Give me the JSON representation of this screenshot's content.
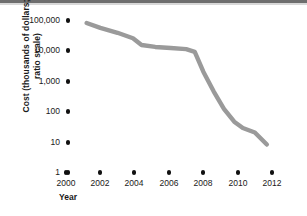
{
  "chart_data": {
    "type": "line",
    "title": "",
    "xlabel": "Year",
    "ylabel": "Cost (thousands of dollars; ratio scale)",
    "ylabel_line1": "Cost (thousands of dollars;",
    "ylabel_line2": "ratio scale)",
    "yscale": "log",
    "ylim": [
      1,
      100000
    ],
    "xlim": [
      2000,
      2012
    ],
    "grid": false,
    "legend": null,
    "y_ticks": [
      {
        "value": 100000,
        "label": "100,000"
      },
      {
        "value": 10000,
        "label": "10,000"
      },
      {
        "value": 1000,
        "label": "1,000"
      },
      {
        "value": 100,
        "label": "100"
      },
      {
        "value": 10,
        "label": "10"
      },
      {
        "value": 1,
        "label": "1"
      }
    ],
    "x_ticks": [
      {
        "value": 2000,
        "label": "2000"
      },
      {
        "value": 2002,
        "label": "2002"
      },
      {
        "value": 2004,
        "label": "2004"
      },
      {
        "value": 2006,
        "label": "2006"
      },
      {
        "value": 2008,
        "label": "2008"
      },
      {
        "value": 2010,
        "label": "2010"
      },
      {
        "value": 2012,
        "label": "2012"
      }
    ],
    "series": [
      {
        "name": "Cost",
        "color": "#9a9a9a",
        "x": [
          2001.2,
          2002.0,
          2003.0,
          2003.9,
          2004.4,
          2005.2,
          2006.1,
          2007.0,
          2007.5,
          2008.0,
          2008.6,
          2009.2,
          2009.8,
          2010.3,
          2011.0,
          2011.7
        ],
        "y": [
          80000,
          55000,
          38000,
          25000,
          15000,
          13000,
          12000,
          11000,
          9000,
          2000,
          450,
          120,
          45,
          28,
          20,
          8
        ]
      }
    ]
  },
  "axis": {
    "y_title": "Cost (thousands of dollars; ratio scale)",
    "x_title": "Year"
  }
}
